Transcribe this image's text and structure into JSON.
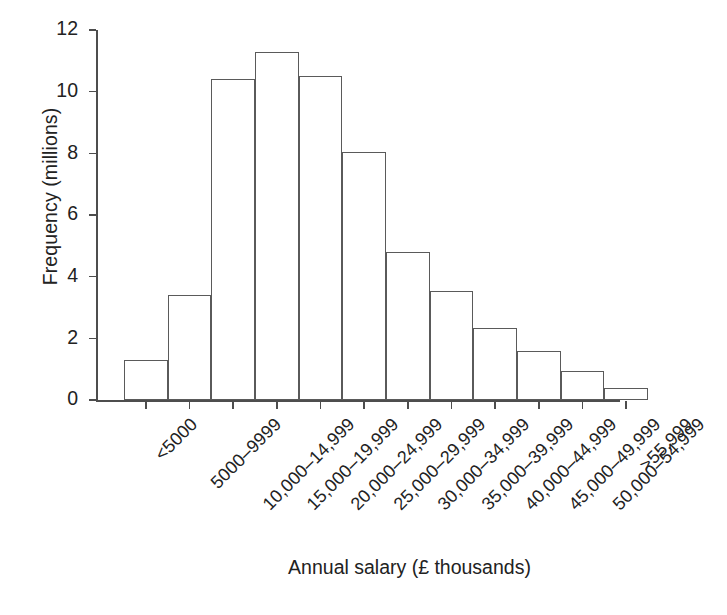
{
  "chart_data": {
    "type": "bar",
    "title": "",
    "subtitle": "",
    "xlabel": "Annual salary (£ thousands)",
    "ylabel": "Frequency (millions)",
    "categories": [
      "<5000",
      "5000–9999",
      "10,000–14,999",
      "15,000–19,999",
      "20,000–24,999",
      "25,000–29,999",
      "30,000–34,999",
      "35,000–39,999",
      "40,000–44,999",
      "45,000–49,999",
      "50,000–54,999",
      ">55,999"
    ],
    "values": [
      1.3,
      3.4,
      10.4,
      11.3,
      10.5,
      8.05,
      4.8,
      3.55,
      2.35,
      1.6,
      0.93,
      0.4
    ],
    "ylim": [
      0,
      12
    ],
    "ytick_values": [
      0,
      2,
      4,
      6,
      8,
      10,
      12
    ],
    "ytick_labels": [
      "0",
      "2",
      "4",
      "6",
      "8",
      "10",
      "12"
    ],
    "grid": false,
    "legend": false,
    "legend_position": "none",
    "bar_fill_color": "#ffffff",
    "bar_edge_color": "#5a5a5a",
    "axis_color": "#4d4d4d",
    "text_color": "#222222",
    "background_color": "#ffffff"
  }
}
